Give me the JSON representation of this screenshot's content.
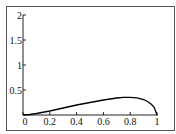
{
  "chart_data": {
    "type": "line",
    "title": "",
    "xlabel": "",
    "ylabel": "",
    "xlim": [
      0,
      1
    ],
    "ylim": [
      0,
      2
    ],
    "grid": false,
    "frame": true,
    "x_ticks": [
      "0",
      "0.2",
      "0.4",
      "0.6",
      "0.8",
      "1"
    ],
    "y_ticks": [
      "0.5",
      "1",
      "1.5",
      "2"
    ],
    "series": [
      {
        "name": "curve",
        "color": "#000000",
        "x": [
          0,
          0.05,
          0.1,
          0.2,
          0.3,
          0.4,
          0.5,
          0.6,
          0.7,
          0.75,
          0.8,
          0.85,
          0.9,
          0.93,
          0.96,
          0.98,
          1.0
        ],
        "y": [
          0,
          0.01,
          0.03,
          0.08,
          0.14,
          0.2,
          0.25,
          0.3,
          0.34,
          0.355,
          0.355,
          0.345,
          0.31,
          0.27,
          0.21,
          0.15,
          0
        ]
      }
    ]
  },
  "colors": {
    "axis": "#222222",
    "frame": "#555555",
    "background": "#ffffff"
  }
}
